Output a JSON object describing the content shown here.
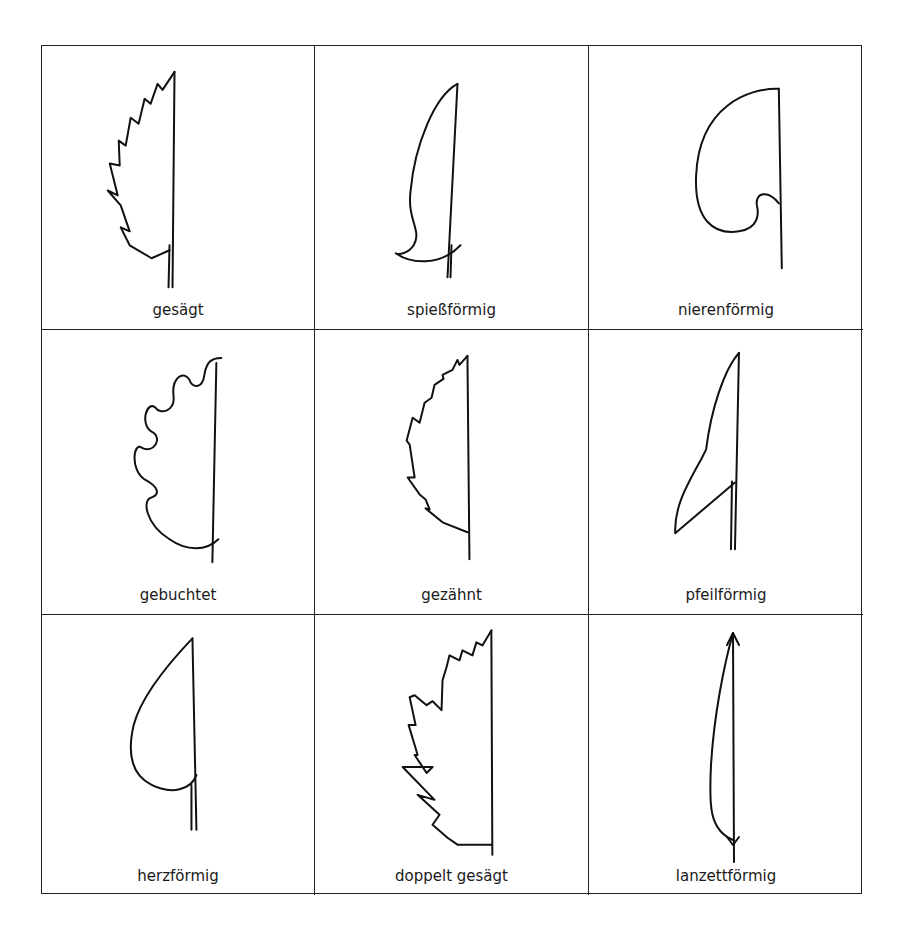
{
  "grid": {
    "rows": 3,
    "columns": 3,
    "line_color": "#222222"
  },
  "cells": [
    {
      "label": "gesägt",
      "shape": "serrate-leaf"
    },
    {
      "label": "spießförmig",
      "shape": "hastate-leaf"
    },
    {
      "label": "nierenförmig",
      "shape": "reniform-leaf"
    },
    {
      "label": "gebuchtet",
      "shape": "sinuate-leaf"
    },
    {
      "label": "gezähnt",
      "shape": "dentate-leaf"
    },
    {
      "label": "pfeilförmig",
      "shape": "sagittate-leaf"
    },
    {
      "label": "herzförmig",
      "shape": "cordate-leaf"
    },
    {
      "label": "doppelt gesägt",
      "shape": "doubly-serrate-leaf"
    },
    {
      "label": "lanzettförmig",
      "shape": "lanceolate-leaf"
    }
  ]
}
